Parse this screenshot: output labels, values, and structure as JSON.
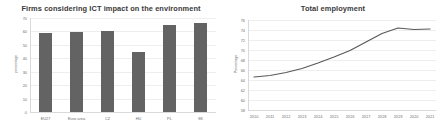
{
  "charts": [
    {
      "title": "Firms considering ICT impact on the environment",
      "ylabel": "percentage",
      "xlabel": "",
      "accent": "#636363"
    },
    {
      "title": "Total employment",
      "ylabel": "Percentage",
      "xlabel": "",
      "accent": "#595959"
    }
  ],
  "chart_data": [
    {
      "type": "bar",
      "title": "Firms considering ICT impact on the environment",
      "xlabel": "",
      "ylabel": "percentage",
      "categories": [
        "EU27",
        "Euro area",
        "CZ",
        "HU",
        "PL",
        "SK"
      ],
      "values": [
        58.5,
        59.5,
        60.0,
        45.0,
        64.5,
        66.5
      ],
      "ylim": [
        0,
        70
      ],
      "yticks": [
        0,
        10,
        20,
        30,
        40,
        50,
        60,
        70
      ],
      "grid": true,
      "legend": "none",
      "bar_color": "#636363"
    },
    {
      "type": "line",
      "title": "Total employment",
      "xlabel": "",
      "ylabel": "Percentage",
      "x": [
        2010,
        2011,
        2012,
        2013,
        2014,
        2015,
        2016,
        2017,
        2018,
        2019,
        2020,
        2021
      ],
      "values": [
        64.6,
        64.9,
        65.5,
        66.3,
        67.4,
        68.6,
        69.9,
        71.6,
        73.3,
        74.4,
        74.1,
        74.2
      ],
      "ylim": [
        58,
        76
      ],
      "yticks": [
        58,
        60,
        62,
        64,
        66,
        68,
        70,
        72,
        74,
        76
      ],
      "xticks": [
        "2010",
        "2011",
        "2012",
        "2013",
        "2014",
        "2015",
        "2016",
        "2017",
        "2018",
        "2019",
        "2020",
        "2021"
      ],
      "grid": true,
      "legend": "none",
      "line_color": "#595959"
    }
  ]
}
